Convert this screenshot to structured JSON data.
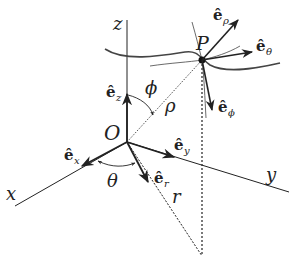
{
  "diagram": {
    "axes": {
      "x": "x",
      "y": "y",
      "z": "z"
    },
    "origin": "O",
    "point": "P",
    "angles": {
      "theta": "θ",
      "phi": "ϕ"
    },
    "lengths": {
      "rho": "ρ",
      "r": "r"
    },
    "unit_vectors": {
      "ex": {
        "hat": "ê",
        "sub": "x"
      },
      "ey": {
        "hat": "ê",
        "sub": "y"
      },
      "ez": {
        "hat": "ê",
        "sub": "z"
      },
      "er": {
        "hat": "ê",
        "sub": "r"
      },
      "erho": {
        "hat": "ê",
        "sub": "ρ"
      },
      "etheta": {
        "hat": "ê",
        "sub": "θ"
      },
      "ephi": {
        "hat": "ê",
        "sub": "ϕ"
      }
    },
    "colors": {
      "line": "#222222",
      "background": "#ffffff"
    }
  }
}
